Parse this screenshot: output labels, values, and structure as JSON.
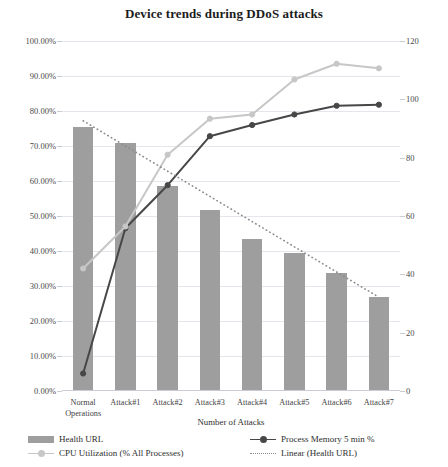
{
  "chart_data": {
    "type": "bar",
    "title": "Device trends during DDoS attacks",
    "xlabel": "Number of Attacks",
    "ylabel": "",
    "categories": [
      "Normal\nOperations",
      "Attack#1",
      "Attack#2",
      "Attack#3",
      "Attack#4",
      "Attack#5",
      "Attack#6",
      "Attack#7"
    ],
    "y_left_ticks": [
      "0.00%",
      "10.00%",
      "20.00%",
      "30.00%",
      "40.00%",
      "50.00%",
      "60.00%",
      "70.00%",
      "80.00%",
      "90.00%",
      "100.00%"
    ],
    "y_right_ticks": [
      "0",
      "20",
      "40",
      "60",
      "80",
      "100",
      "120"
    ],
    "ylim": [
      0,
      100
    ],
    "y2lim": [
      0,
      120
    ],
    "grid": true,
    "legend_position": "bottom",
    "series": [
      {
        "name": "Health URL",
        "kind": "bar",
        "axis": "left",
        "color": "#9e9e9e",
        "values": [
          75.5,
          71.0,
          58.5,
          51.8,
          43.5,
          39.5,
          33.8,
          27.0
        ]
      },
      {
        "name": "Process Memory 5 min %",
        "kind": "line",
        "axis": "left",
        "color": "#474747",
        "values": [
          5.0,
          46.5,
          58.8,
          72.8,
          76.0,
          79.0,
          81.5,
          81.8
        ]
      },
      {
        "name": "CPU Utilization (% All Processes)",
        "kind": "line",
        "axis": "left",
        "color": "#c7c7c7",
        "values": [
          35.0,
          47.0,
          67.5,
          77.8,
          79.0,
          89.0,
          93.5,
          92.2
        ]
      },
      {
        "name": "Linear (Health URL)",
        "kind": "dotted-trend",
        "axis": "left",
        "color": "#8a8a8a",
        "values": [
          77.2,
          70.0,
          62.8,
          55.6,
          48.4,
          41.2,
          34.0,
          26.8
        ]
      }
    ]
  },
  "legend": {
    "items": [
      {
        "label": "Health URL",
        "swatch": "bar-swatch"
      },
      {
        "label": "Process Memory 5 min %",
        "swatch": "line-swatch-dark"
      },
      {
        "label": "CPU Utilization (% All Processes)",
        "swatch": "line-swatch-light"
      },
      {
        "label": "Linear (Health URL)",
        "swatch": "dotted-swatch"
      }
    ]
  }
}
